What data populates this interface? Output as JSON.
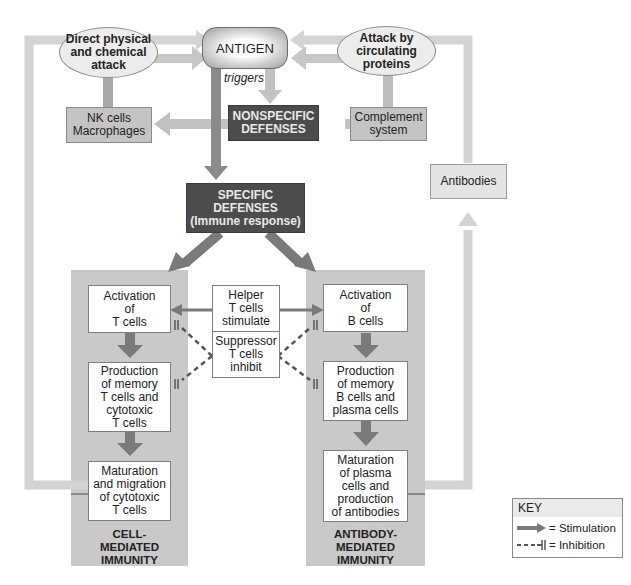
{
  "colors": {
    "panel": "#c9c9c9",
    "dark_box": "#4c4c4c",
    "gray_box": "#c4c4c4",
    "light_arrow": "#cfcfcf",
    "stimulation_arrow": "#777777",
    "inhibition_line": "#555555"
  },
  "top": {
    "antigen": "ANTIGEN",
    "triggers": "triggers",
    "direct_attack": "Direct physical\nand chemical\nattack",
    "circulating_attack": "Attack by\ncirculating\nproteins",
    "nk_cells": "NK cells\nMacrophages",
    "nonspecific": "NONSPECIFIC\nDEFENSES",
    "complement": "Complement\nsystem",
    "antibodies": "Antibodies",
    "specific": "SPECIFIC\nDEFENSES\n(Immune response)"
  },
  "left_panel": {
    "steps": [
      "Activation\nof\nT cells",
      "Production\nof memory\nT cells and\ncytotoxic\nT cells",
      "Maturation\nand migration\nof cytotoxic\nT cells"
    ],
    "label": "CELL-\nMEDIATED\nIMMUNITY"
  },
  "center": {
    "helper": "Helper\nT cells\nstimulate",
    "suppressor": "Suppressor\nT cells\ninhibit"
  },
  "right_panel": {
    "steps": [
      "Activation\nof\nB cells",
      "Production\nof memory\nB cells and\nplasma cells",
      "Maturation\nof plasma\ncells and\nproduction\nof antibodies"
    ],
    "label": "ANTIBODY-\nMEDIATED\nIMMUNITY"
  },
  "key": {
    "title": "KEY",
    "stimulation": "= Stimulation",
    "inhibition": "= Inhibition"
  }
}
